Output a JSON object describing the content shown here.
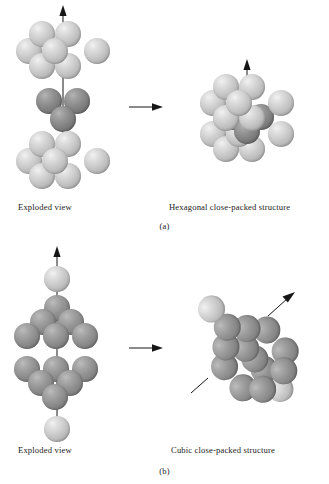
{
  "figure": {
    "background_color": "#ffffff",
    "ink_color": "#161616"
  },
  "colors": {
    "light_sphere": "#cfcfcf",
    "dark_sphere": "#8d8d8d",
    "mid_sphere": "#979797",
    "arrow": "#161616",
    "text": "#1c1c1c"
  },
  "panels": [
    {
      "id": "a",
      "panel_label": "(a)",
      "left_caption": "Exploded view",
      "right_caption": "Hexagonal close-packed structure",
      "transition_arrow": "right-arrow",
      "exploded_view": {
        "axis_arrow": "vertical-up-arrow",
        "layers": [
          {
            "name": "top-layer",
            "sphere_count": 7,
            "shade": "light",
            "arrangement": "hexagonal"
          },
          {
            "name": "middle-layer",
            "sphere_count": 3,
            "shade": "dark",
            "arrangement": "triangular"
          },
          {
            "name": "bottom-layer",
            "sphere_count": 7,
            "shade": "light",
            "arrangement": "hexagonal"
          }
        ]
      },
      "assembled_view": {
        "axis_arrow": "vertical-up-arrow",
        "layers": [
          {
            "name": "upper-layer",
            "sphere_count": 7,
            "shade": "light",
            "arrangement": "hexagonal"
          },
          {
            "name": "interstitial-layer",
            "sphere_count": 3,
            "shade": "dark",
            "arrangement": "triangular"
          },
          {
            "name": "lower-layer",
            "sphere_count": 7,
            "shade": "light",
            "arrangement": "hexagonal"
          }
        ]
      }
    },
    {
      "id": "b",
      "panel_label": "(b)",
      "left_caption": "Exploded view",
      "right_caption": "Cubic close-packed structure",
      "transition_arrow": "right-arrow",
      "exploded_view": {
        "axis_arrow": "vertical-up-arrow",
        "layers": [
          {
            "name": "apex-sphere",
            "sphere_count": 1,
            "shade": "light",
            "arrangement": "single"
          },
          {
            "name": "upper-triangle-layer",
            "sphere_count": 6,
            "shade": "mid",
            "arrangement": "triangular"
          },
          {
            "name": "lower-triangle-layer",
            "sphere_count": 6,
            "shade": "mid",
            "arrangement": "triangular"
          },
          {
            "name": "base-sphere",
            "sphere_count": 1,
            "shade": "light",
            "arrangement": "single"
          }
        ]
      },
      "assembled_view": {
        "axis_arrow": "diagonal-up-right-arrow",
        "orientation": "tilted body diagonal",
        "layers": [
          {
            "name": "apex-sphere",
            "sphere_count": 1,
            "shade": "light",
            "arrangement": "single"
          },
          {
            "name": "upper-triangle-layer",
            "sphere_count": 6,
            "shade": "mid",
            "arrangement": "triangular"
          },
          {
            "name": "lower-triangle-layer",
            "sphere_count": 6,
            "shade": "mid",
            "arrangement": "triangular"
          },
          {
            "name": "base-sphere",
            "sphere_count": 1,
            "shade": "light",
            "arrangement": "single"
          }
        ]
      }
    }
  ]
}
